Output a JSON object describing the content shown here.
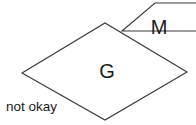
{
  "diagram": {
    "background_color": "#ffffff",
    "stroke_color": "#3a3a3a",
    "label_color": "#1a1a1a",
    "shapes": [
      {
        "id": "plane-m",
        "label": "M",
        "points": "122,31 155,3 232,3 199,31",
        "label_x": 159,
        "label_y": 29
      },
      {
        "id": "plane-g",
        "label": "G",
        "points": "22,73 105,23 187,72 105,120",
        "label_x": 107,
        "label_y": 73
      }
    ],
    "m_bottom_edge": "122,31 163,49",
    "m_right_edge": "163,49 196,49"
  },
  "caption": {
    "text": "not okay",
    "x": 6,
    "y": 99
  }
}
